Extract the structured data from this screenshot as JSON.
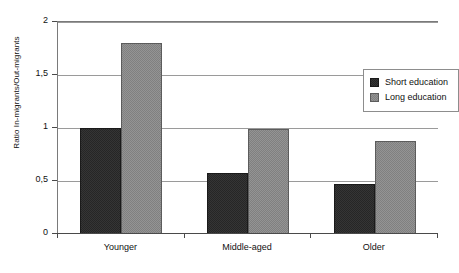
{
  "chart_data": {
    "type": "bar",
    "title": "",
    "subtitle": "",
    "xlabel": "",
    "ylabel": "Ratio In-migrants/Out-migrants",
    "categories": [
      "Younger",
      "Middle-aged",
      "Older"
    ],
    "series": [
      {
        "name": "Short education",
        "color": "#262626",
        "values": [
          1.0,
          0.58,
          0.47
        ]
      },
      {
        "name": "Long education",
        "color": "#808080",
        "values": [
          1.8,
          0.99,
          0.88
        ]
      }
    ],
    "ylim": [
      0,
      2
    ],
    "ytick_values": [
      0,
      0.5,
      1,
      1.5,
      2
    ],
    "ytick_labels": [
      "0",
      "0,5",
      "1",
      "1,5",
      "2"
    ],
    "grid": true,
    "grid_axis": "y",
    "legend_position": "top-right-inside",
    "annotations": []
  },
  "legend": {
    "entries": [
      {
        "label": "Short education",
        "swatch": "short-education-swatch"
      },
      {
        "label": "Long education",
        "swatch": "long-education-swatch"
      }
    ]
  }
}
